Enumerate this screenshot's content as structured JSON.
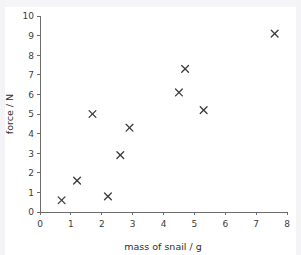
{
  "chart_data": {
    "type": "scatter",
    "title": "",
    "xlabel": "mass of snail / g",
    "ylabel": "force / N",
    "xlim": [
      0,
      8
    ],
    "ylim": [
      0,
      10
    ],
    "xticks": [
      0,
      1,
      2,
      3,
      4,
      5,
      6,
      7,
      8
    ],
    "yticks": [
      0,
      1,
      2,
      3,
      4,
      5,
      6,
      7,
      8,
      9,
      10
    ],
    "xtick_labels": [
      "0",
      "1",
      "2",
      "3",
      "4",
      "5",
      "6",
      "7",
      "8"
    ],
    "ytick_labels": [
      "0",
      "1",
      "2",
      "3",
      "4",
      "5",
      "6",
      "7",
      "8",
      "9",
      "10"
    ],
    "grid": false,
    "legend": false,
    "marker": "x",
    "marker_color": "#3a3a3a",
    "axis_color": "#6b6b6b",
    "background": "#ffffff",
    "series": [
      {
        "name": "snail force data",
        "points": [
          {
            "x": 0.7,
            "y": 0.6
          },
          {
            "x": 1.2,
            "y": 1.6
          },
          {
            "x": 1.7,
            "y": 5.0
          },
          {
            "x": 2.2,
            "y": 0.8
          },
          {
            "x": 2.6,
            "y": 2.9
          },
          {
            "x": 2.9,
            "y": 4.3
          },
          {
            "x": 4.5,
            "y": 6.1
          },
          {
            "x": 4.7,
            "y": 7.3
          },
          {
            "x": 5.3,
            "y": 5.2
          },
          {
            "x": 7.6,
            "y": 9.1
          }
        ]
      }
    ]
  },
  "plot_geometry": {
    "origin_x": 40,
    "origin_y": 212,
    "right_x": 287,
    "top_y": 16,
    "marker_half": 3.4,
    "tick_len": 3,
    "xlabel_x": 163,
    "xlabel_y": 250,
    "ylabel_x": 13,
    "ylabel_y": 114
  }
}
